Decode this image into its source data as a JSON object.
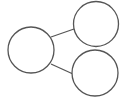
{
  "diagram": {
    "stroke_color": "#555555",
    "background": "#ffffff",
    "nodes": [
      {
        "id": "left",
        "cx": 31,
        "cy": 50,
        "r": 23,
        "label": ""
      },
      {
        "id": "top-right",
        "cx": 96,
        "cy": 24,
        "r": 22.5,
        "label": ""
      },
      {
        "id": "bottom-right",
        "cx": 95,
        "cy": 73,
        "r": 23,
        "label": ""
      }
    ],
    "edges": [
      {
        "from": "left",
        "to": "top-right",
        "x1": 51,
        "y1": 37,
        "x2": 74,
        "y2": 29
      },
      {
        "from": "left",
        "to": "bottom-right",
        "x1": 51,
        "y1": 64,
        "x2": 73,
        "y2": 74
      }
    ]
  }
}
